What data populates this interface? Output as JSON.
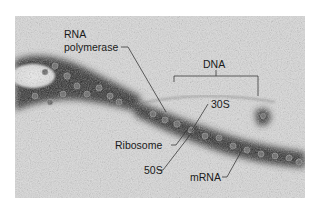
{
  "figure": {
    "type": "electron-micrograph",
    "labels": {
      "rna_polymerase_line1": "RNA",
      "rna_polymerase_line2": "polymerase",
      "dna": "DNA",
      "subunit_30s": "30S",
      "ribosome": "Ribosome",
      "subunit_50s": "50S",
      "mrna": "mRNA"
    },
    "colors": {
      "background": "#c9c9c9",
      "dense_stain": "#2a2a2a",
      "label_text": "#1a1a1a",
      "leader_line": "#3a3a3a"
    }
  }
}
